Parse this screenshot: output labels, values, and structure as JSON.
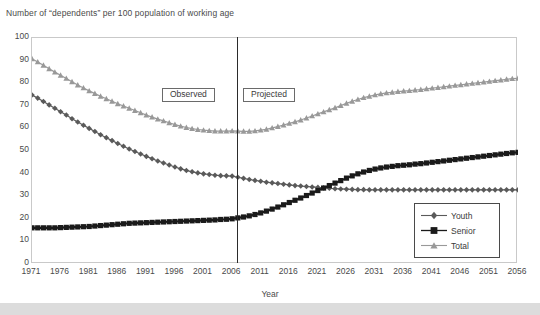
{
  "chart_data": {
    "type": "line",
    "title": "Number of “dependents” per 100 population of working age",
    "xlabel": "Year",
    "ylabel": "",
    "xlim": [
      1971,
      2056
    ],
    "ylim": [
      0,
      100
    ],
    "grid": false,
    "legend_position": "bottom-right",
    "ytick_labels": [
      "0",
      "10",
      "20",
      "30",
      "40",
      "50",
      "60",
      "70",
      "80",
      "90",
      "100"
    ],
    "ytick_values": [
      0,
      10,
      20,
      30,
      40,
      50,
      60,
      70,
      80,
      90,
      100
    ],
    "xtick_labels": [
      "1971",
      "1976",
      "1981",
      "1986",
      "1991",
      "1996",
      "2001",
      "2006",
      "2011",
      "2016",
      "2021",
      "2026",
      "2031",
      "2036",
      "2041",
      "2046",
      "2051",
      "2056"
    ],
    "xtick_values": [
      1971,
      1976,
      1981,
      1986,
      1991,
      1996,
      2001,
      2006,
      2011,
      2016,
      2021,
      2026,
      2031,
      2036,
      2041,
      2046,
      2051,
      2056
    ],
    "annotations": [
      {
        "text": "Observed",
        "x": 1997,
        "y": 72,
        "boxed": true
      },
      {
        "text": "Projected",
        "x": 2012,
        "y": 72,
        "boxed": true
      },
      {
        "text": "divider-line",
        "x": 2006,
        "type": "vline"
      }
    ],
    "x": [
      1971,
      1972,
      1973,
      1974,
      1975,
      1976,
      1977,
      1978,
      1979,
      1980,
      1981,
      1982,
      1983,
      1984,
      1985,
      1986,
      1987,
      1988,
      1989,
      1990,
      1991,
      1992,
      1993,
      1994,
      1995,
      1996,
      1997,
      1998,
      1999,
      2000,
      2001,
      2002,
      2003,
      2004,
      2005,
      2006,
      2007,
      2008,
      2009,
      2010,
      2011,
      2012,
      2013,
      2014,
      2015,
      2016,
      2017,
      2018,
      2019,
      2020,
      2021,
      2022,
      2023,
      2024,
      2025,
      2026,
      2027,
      2028,
      2029,
      2030,
      2031,
      2032,
      2033,
      2034,
      2035,
      2036,
      2037,
      2038,
      2039,
      2040,
      2041,
      2042,
      2043,
      2044,
      2045,
      2046,
      2047,
      2048,
      2049,
      2050,
      2051,
      2052,
      2053,
      2054,
      2055,
      2056
    ],
    "series": [
      {
        "name": "Youth",
        "marker": "diamond",
        "color": "#5a5a5a",
        "values": [
          74.8,
          73.4,
          71.9,
          70.4,
          68.9,
          67.4,
          65.9,
          64.3,
          62.8,
          61.4,
          60.0,
          58.6,
          57.2,
          55.9,
          54.6,
          53.3,
          52.1,
          50.9,
          49.8,
          48.7,
          47.6,
          46.6,
          45.6,
          44.7,
          43.8,
          42.9,
          42.1,
          41.4,
          40.8,
          40.3,
          39.9,
          39.6,
          39.3,
          39.1,
          39.0,
          38.9,
          38.4,
          37.9,
          37.4,
          37.0,
          36.6,
          36.2,
          35.9,
          35.6,
          35.3,
          35.0,
          34.7,
          34.5,
          34.3,
          34.1,
          33.9,
          33.7,
          33.5,
          33.3,
          33.2,
          33.1,
          33.0,
          32.9,
          32.9,
          32.8,
          32.8,
          32.8,
          32.8,
          32.8,
          32.8,
          32.8,
          32.8,
          32.8,
          32.8,
          32.8,
          32.8,
          32.8,
          32.8,
          32.8,
          32.8,
          32.8,
          32.8,
          32.8,
          32.8,
          32.8,
          32.8,
          32.8,
          32.8,
          32.8,
          32.8,
          32.8
        ]
      },
      {
        "name": "Senior",
        "marker": "square",
        "color": "#1a1a1a",
        "values": [
          16.0,
          16.0,
          16.0,
          16.0,
          16.0,
          16.1,
          16.2,
          16.3,
          16.4,
          16.5,
          16.6,
          16.8,
          17.0,
          17.2,
          17.4,
          17.6,
          17.8,
          18.0,
          18.1,
          18.2,
          18.3,
          18.4,
          18.5,
          18.6,
          18.7,
          18.8,
          18.9,
          19.0,
          19.1,
          19.2,
          19.3,
          19.4,
          19.5,
          19.7,
          19.8,
          20.0,
          20.4,
          20.8,
          21.3,
          21.9,
          22.6,
          23.4,
          24.3,
          25.2,
          26.2,
          27.2,
          28.2,
          29.2,
          30.3,
          31.4,
          32.5,
          33.6,
          34.7,
          35.8,
          36.9,
          38.0,
          39.0,
          39.9,
          40.7,
          41.4,
          42.0,
          42.5,
          42.9,
          43.2,
          43.5,
          43.7,
          43.9,
          44.2,
          44.4,
          44.7,
          45.0,
          45.3,
          45.6,
          45.9,
          46.2,
          46.5,
          46.8,
          47.1,
          47.4,
          47.7,
          48.0,
          48.3,
          48.6,
          48.9,
          49.2,
          49.4
        ]
      },
      {
        "name": "Total",
        "marker": "triangle",
        "color": "#999999",
        "values": [
          90.8,
          89.4,
          87.9,
          86.4,
          84.9,
          83.5,
          82.1,
          80.6,
          79.2,
          77.9,
          76.6,
          75.4,
          74.2,
          73.1,
          72.0,
          70.9,
          69.9,
          68.9,
          67.9,
          66.9,
          65.9,
          65.0,
          64.1,
          63.3,
          62.5,
          61.7,
          61.0,
          60.4,
          59.9,
          59.5,
          59.2,
          59.0,
          58.8,
          58.8,
          58.8,
          58.9,
          58.8,
          58.7,
          58.7,
          58.9,
          59.2,
          59.6,
          60.2,
          60.8,
          61.5,
          62.2,
          62.9,
          63.7,
          64.6,
          65.5,
          66.4,
          67.3,
          68.2,
          69.1,
          70.1,
          71.1,
          72.0,
          72.8,
          73.6,
          74.2,
          74.8,
          75.3,
          75.7,
          76.0,
          76.3,
          76.5,
          76.7,
          77.0,
          77.2,
          77.5,
          77.8,
          78.1,
          78.4,
          78.7,
          79.0,
          79.3,
          79.6,
          79.9,
          80.2,
          80.5,
          80.8,
          81.1,
          81.4,
          81.7,
          82.0,
          82.2
        ]
      }
    ]
  },
  "legend": {
    "entries": [
      {
        "label": "Youth"
      },
      {
        "label": "Senior"
      },
      {
        "label": "Total"
      }
    ]
  }
}
